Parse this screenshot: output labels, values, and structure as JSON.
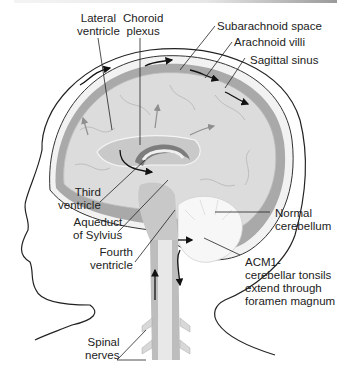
{
  "diagram": {
    "colors": {
      "skin_outline": "#222222",
      "skull": "#f2f2f2",
      "dura": "#a9a9a9",
      "brain": "#dcdcdc",
      "ventricle": "#c2c2c2",
      "cerebellum": "#f7f7f7",
      "choroid": "#7d7d7d",
      "arrow": "#111111",
      "flow_arrow": "#8f8f8f"
    },
    "labels": {
      "lateral_ventricle": [
        "Lateral",
        "ventricle"
      ],
      "choroid_plexus": [
        "Choroid",
        "plexus"
      ],
      "subarachnoid_space": [
        "Subarachnoid space"
      ],
      "arachnoid_villi": [
        "Arachnoid villi"
      ],
      "sagittal_sinus": [
        "Sagittal sinus"
      ],
      "third_ventricle": [
        "Third",
        "ventricle"
      ],
      "aqueduct_of_sylvius": [
        "Aqueduct",
        "of Sylvius"
      ],
      "fourth_ventricle": [
        "Fourth",
        "ventricle"
      ],
      "normal_cerebellum": [
        "Normal",
        "cerebellum"
      ],
      "acm1": [
        "ACM1-",
        "cerebellar tonsils",
        "extend through",
        "foramen magnum"
      ],
      "spinal_nerves": [
        "Spinal",
        "nerves"
      ]
    }
  }
}
